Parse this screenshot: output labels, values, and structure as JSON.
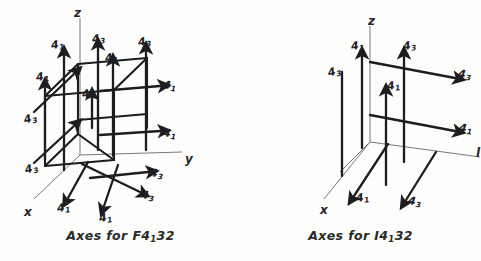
{
  "figure": {
    "background_color": "#fdfdfc",
    "ink_color": "#1d1d21",
    "thin_axis_color": "#6e6e72"
  },
  "panels": [
    {
      "id": "left",
      "caption_prefix": "Axes for",
      "caption_symbol": "F",
      "caption_number": "4",
      "caption_subscript": "1",
      "caption_suffix": "32",
      "axes": [
        {
          "name": "z-axis-label",
          "text": "z",
          "x": 74,
          "y": 6
        },
        {
          "name": "y-axis-label",
          "text": "y",
          "x": 185,
          "y": 152
        },
        {
          "name": "x-axis-label",
          "text": "x",
          "x": 24,
          "y": 205
        }
      ],
      "screw_labels": [
        {
          "name": "screw-label-a",
          "base": "4",
          "sub": "1",
          "x": 51,
          "y": 39,
          "rot": "r-8"
        },
        {
          "name": "screw-label-b",
          "base": "4",
          "sub": "3",
          "x": 92,
          "y": 33,
          "rot": "r-8"
        },
        {
          "name": "screw-label-c",
          "base": "4",
          "sub": "1",
          "x": 105,
          "y": 52,
          "rot": "r-8"
        },
        {
          "name": "screw-label-d",
          "base": "4",
          "sub": "3",
          "x": 138,
          "y": 36,
          "rot": "r-8"
        },
        {
          "name": "screw-label-e",
          "base": "4",
          "sub": "1",
          "x": 36,
          "y": 71,
          "rot": "r-8"
        },
        {
          "name": "screw-label-f",
          "base": "4",
          "sub": "1",
          "x": 82,
          "y": 88,
          "rot": "r-8"
        },
        {
          "name": "screw-label-g",
          "base": "4",
          "sub": "1",
          "x": 163,
          "y": 80,
          "rot": "r6"
        },
        {
          "name": "screw-label-h",
          "base": "4",
          "sub": "3",
          "x": 24,
          "y": 113,
          "rot": "r-14"
        },
        {
          "name": "screw-label-i",
          "base": "4",
          "sub": "1",
          "x": 163,
          "y": 128,
          "rot": "r6"
        },
        {
          "name": "screw-label-j",
          "base": "4",
          "sub": "3",
          "x": 25,
          "y": 163,
          "rot": "r-14"
        },
        {
          "name": "screw-label-k",
          "base": "4",
          "sub": "3",
          "x": 150,
          "y": 168,
          "rot": "r6"
        },
        {
          "name": "screw-label-l",
          "base": "4",
          "sub": "1",
          "x": 57,
          "y": 202,
          "rot": "r-8"
        },
        {
          "name": "screw-label-m",
          "base": "4",
          "sub": "3",
          "x": 141,
          "y": 190,
          "rot": "r6"
        },
        {
          "name": "screw-label-n",
          "base": "4",
          "sub": "1",
          "x": 99,
          "y": 212,
          "rot": "r-8"
        }
      ]
    },
    {
      "id": "right",
      "caption_prefix": "Axes for",
      "caption_symbol": "I",
      "caption_number": "4",
      "caption_subscript": "1",
      "caption_suffix": "32",
      "axes": [
        {
          "name": "z-axis-label",
          "text": "z",
          "x": 128,
          "y": 14
        },
        {
          "name": "y-axis-label",
          "text": "l",
          "x": 236,
          "y": 146
        },
        {
          "name": "x-axis-label",
          "text": "x",
          "x": 80,
          "y": 203
        }
      ],
      "screw_labels": [
        {
          "name": "screw-label-a",
          "base": "4",
          "sub": "1",
          "x": 111,
          "y": 40,
          "rot": "r-8"
        },
        {
          "name": "screw-label-b",
          "base": "4",
          "sub": "3",
          "x": 163,
          "y": 40,
          "rot": "r-8"
        },
        {
          "name": "screw-label-c",
          "base": "4",
          "sub": "3",
          "x": 88,
          "y": 66,
          "rot": "r-14"
        },
        {
          "name": "screw-label-d",
          "base": "4",
          "sub": "3",
          "x": 218,
          "y": 69,
          "rot": "r6"
        },
        {
          "name": "screw-label-e",
          "base": "4",
          "sub": "1",
          "x": 147,
          "y": 80,
          "rot": "r-8"
        },
        {
          "name": "screw-label-f",
          "base": "4",
          "sub": "1",
          "x": 219,
          "y": 123,
          "rot": "r6"
        },
        {
          "name": "screw-label-g",
          "base": "4",
          "sub": "1",
          "x": 116,
          "y": 192,
          "rot": "r-8"
        },
        {
          "name": "screw-label-h",
          "base": "4",
          "sub": "3",
          "x": 168,
          "y": 196,
          "rot": "r6"
        }
      ]
    }
  ]
}
